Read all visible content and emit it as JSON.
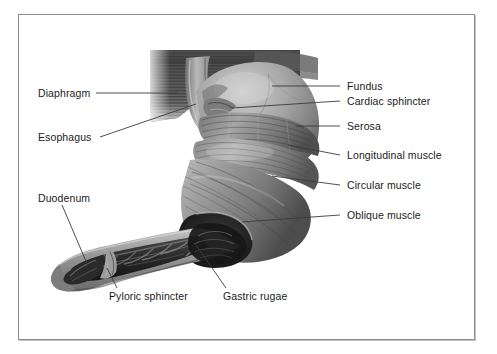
{
  "figure": {
    "frame": {
      "border_color": "#8a8d92",
      "background": "#ffffff"
    },
    "text_color": "#1b1b1b",
    "leader_line_color": "#3b3b3b"
  },
  "labels": {
    "diaphragm": "Diaphragm",
    "esophagus": "Esophagus",
    "duodenum": "Duodenum",
    "pyloric_sphincter": "Pyloric sphincter",
    "gastric_rugae": "Gastric rugae",
    "fundus": "Fundus",
    "cardiac_sphincter": "Cardiac sphincter",
    "serosa": "Serosa",
    "longitudinal_muscle": "Longitudinal muscle",
    "circular_muscle": "Circular muscle",
    "oblique_muscle": "Oblique muscle"
  },
  "illustration": {
    "palette": {
      "tissue_light": "#c9c9c9",
      "tissue_mid": "#9a9a9a",
      "tissue_dark": "#6d6d6d",
      "tissue_darker": "#4a4a4a",
      "lumen_dark": "#2b2b2b",
      "lumen_black": "#161616",
      "diaphragm_dark": "#555555",
      "highlight": "#e2e2e2"
    },
    "parts": [
      "diaphragm-sheet",
      "esophagus-tube",
      "fundus-dome",
      "cardiac-sphincter-junction",
      "serosa-surface",
      "longitudinal-muscle-band",
      "circular-muscle-band",
      "oblique-muscle-band",
      "stomach-body-curve",
      "gastric-rugae-folds",
      "pyloric-sphincter-constriction",
      "duodenum-segment"
    ]
  }
}
